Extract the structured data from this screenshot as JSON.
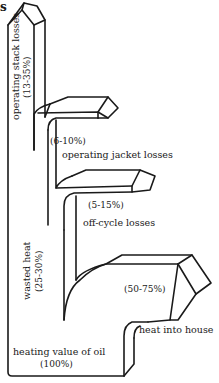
{
  "diagram": {
    "type": "sankey-energy-flow",
    "corner_fragment": "s",
    "input": {
      "label": "heating value of oil",
      "value": "(100%)"
    },
    "wasted_heat": {
      "label": "wasted heat",
      "value": "(25-30%)"
    },
    "flows": [
      {
        "id": "stack",
        "label": "operating stack losses",
        "value": "(13-35%)",
        "orientation": "vertical"
      },
      {
        "id": "jacket",
        "label": "operating jacket losses",
        "value": "(6-10%)",
        "orientation": "horizontal"
      },
      {
        "id": "offcycle",
        "label": "off-cycle losses",
        "value": "(5-15%)",
        "orientation": "horizontal"
      },
      {
        "id": "house",
        "label": "heat into house",
        "value": "(50-75%)",
        "orientation": "horizontal"
      }
    ],
    "colors": {
      "line": "#1a1a1a",
      "background": "#ffffff"
    }
  }
}
